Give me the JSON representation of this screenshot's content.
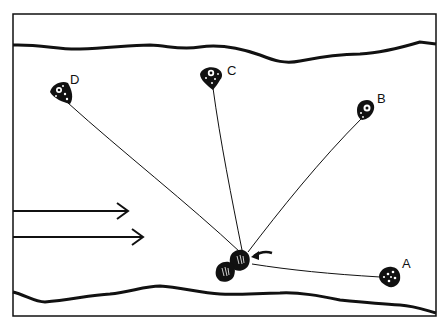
{
  "diagram": {
    "type": "schematic illustration",
    "colors": {
      "ink": "#111111",
      "background": "#ffffff"
    },
    "labels": {
      "a": "A",
      "b": "B",
      "c": "C",
      "d": "D"
    },
    "nodes": [
      {
        "id": "D",
        "x": 62,
        "y": 93
      },
      {
        "id": "C",
        "x": 211,
        "y": 76
      },
      {
        "id": "B",
        "x": 366,
        "y": 110
      },
      {
        "id": "A",
        "x": 388,
        "y": 277
      }
    ],
    "target": {
      "x": 243,
      "y": 255,
      "description": "pair of dark cells"
    },
    "flow_arrows": 2
  }
}
